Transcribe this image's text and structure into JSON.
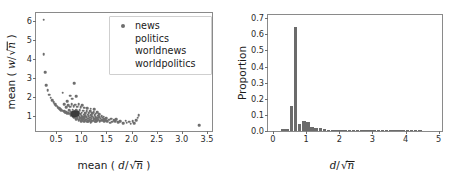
{
  "figure": {
    "panels": [
      "scatter",
      "histogram"
    ]
  },
  "chart_data": [
    {
      "type": "scatter",
      "title": "",
      "xlabel": "mean ( d/√n )",
      "ylabel": "mean ( w/√n )",
      "xlabel_parts": {
        "prefix": "mean (",
        "numerator": "d",
        "slash": "/",
        "radical": "√",
        "radicand": "n",
        "suffix": ")"
      },
      "ylabel_parts": {
        "prefix": "mean (",
        "numerator": "w",
        "slash": "/",
        "radical": "√",
        "radicand": "n",
        "suffix": ")"
      },
      "xlim": [
        0.1,
        3.6
      ],
      "ylim": [
        0.2,
        6.4
      ],
      "xticks": [
        0.5,
        1.0,
        1.5,
        2.0,
        2.5,
        3.0,
        3.5
      ],
      "xticklabels": [
        "0.5",
        "1.0",
        "1.5",
        "2.0",
        "2.5",
        "3.0",
        "3.5"
      ],
      "yticks": [
        1,
        2,
        3,
        4,
        5,
        6
      ],
      "yticklabels": [
        "1",
        "2",
        "3",
        "4",
        "5",
        "6"
      ],
      "grid": false,
      "legend_position": "upper right",
      "legend": [
        {
          "label": "news",
          "marker": "o",
          "color": "#6e6e6e",
          "marker_visible": true
        },
        {
          "label": "politics",
          "marker": "o",
          "color": "#ffffff",
          "marker_visible": false
        },
        {
          "label": "worldnews",
          "marker": "o",
          "color": "#ffffff",
          "marker_visible": false
        },
        {
          "label": "worldpolitics",
          "marker": "o",
          "color": "#ffffff",
          "marker_visible": false
        }
      ],
      "marker_color": "#6e6e6e",
      "points": [
        [
          0.25,
          6.05
        ],
        [
          0.25,
          4.25
        ],
        [
          0.28,
          3.3
        ],
        [
          0.3,
          2.62
        ],
        [
          0.33,
          2.35
        ],
        [
          0.36,
          2.1
        ],
        [
          0.39,
          1.95
        ],
        [
          0.42,
          1.82
        ],
        [
          0.45,
          1.7
        ],
        [
          0.48,
          1.6
        ],
        [
          0.5,
          1.52
        ],
        [
          0.53,
          1.45
        ],
        [
          0.56,
          1.4
        ],
        [
          0.58,
          1.35
        ],
        [
          0.6,
          1.3
        ],
        [
          0.63,
          1.27
        ],
        [
          0.66,
          1.24
        ],
        [
          0.68,
          1.2
        ],
        [
          0.7,
          1.18
        ],
        [
          0.72,
          1.15
        ],
        [
          0.75,
          1.13
        ],
        [
          0.63,
          2.22
        ],
        [
          0.86,
          2.72
        ],
        [
          0.78,
          2.05
        ],
        [
          0.72,
          1.78
        ],
        [
          0.82,
          1.9
        ],
        [
          0.9,
          2.02
        ],
        [
          0.66,
          1.62
        ],
        [
          0.74,
          1.55
        ],
        [
          0.81,
          1.62
        ],
        [
          0.88,
          1.58
        ],
        [
          0.95,
          1.62
        ],
        [
          1.02,
          1.55
        ],
        [
          0.7,
          1.45
        ],
        [
          0.78,
          1.48
        ],
        [
          0.85,
          1.5
        ],
        [
          0.92,
          1.47
        ],
        [
          0.99,
          1.45
        ],
        [
          1.06,
          1.43
        ],
        [
          1.12,
          1.4
        ],
        [
          1.19,
          1.38
        ],
        [
          1.26,
          1.35
        ],
        [
          0.76,
          1.3
        ],
        [
          0.83,
          1.32
        ],
        [
          0.9,
          1.3
        ],
        [
          0.97,
          1.28
        ],
        [
          1.04,
          1.27
        ],
        [
          1.11,
          1.25
        ],
        [
          1.18,
          1.23
        ],
        [
          1.25,
          1.2
        ],
        [
          1.32,
          1.18
        ],
        [
          0.8,
          1.2
        ],
        [
          0.87,
          1.19
        ],
        [
          0.94,
          1.18
        ],
        [
          1.01,
          1.17
        ],
        [
          1.08,
          1.15
        ],
        [
          1.15,
          1.14
        ],
        [
          1.22,
          1.12
        ],
        [
          1.29,
          1.1
        ],
        [
          1.36,
          1.08
        ],
        [
          0.78,
          1.1
        ],
        [
          0.85,
          1.09
        ],
        [
          0.92,
          1.08
        ],
        [
          0.99,
          1.07
        ],
        [
          1.06,
          1.06
        ],
        [
          1.13,
          1.05
        ],
        [
          1.2,
          1.04
        ],
        [
          1.27,
          1.02
        ],
        [
          1.34,
          1.0
        ],
        [
          1.41,
          0.98
        ],
        [
          0.8,
          1.02
        ],
        [
          0.87,
          1.01
        ],
        [
          0.94,
          1.0
        ],
        [
          1.01,
          0.99
        ],
        [
          1.08,
          0.98
        ],
        [
          1.15,
          0.97
        ],
        [
          1.22,
          0.96
        ],
        [
          1.29,
          0.94
        ],
        [
          1.36,
          0.92
        ],
        [
          1.43,
          0.9
        ],
        [
          0.83,
          0.95
        ],
        [
          0.9,
          0.94
        ],
        [
          0.97,
          0.93
        ],
        [
          1.04,
          0.92
        ],
        [
          1.11,
          0.91
        ],
        [
          1.18,
          0.9
        ],
        [
          1.25,
          0.88
        ],
        [
          1.32,
          0.87
        ],
        [
          1.39,
          0.85
        ],
        [
          1.46,
          0.83
        ],
        [
          0.86,
          0.89
        ],
        [
          0.93,
          0.88
        ],
        [
          1.0,
          0.87
        ],
        [
          1.07,
          0.86
        ],
        [
          1.14,
          0.85
        ],
        [
          1.21,
          0.84
        ],
        [
          1.28,
          0.82
        ],
        [
          1.35,
          0.8
        ],
        [
          1.42,
          0.78
        ],
        [
          1.49,
          0.76
        ],
        [
          0.9,
          0.83
        ],
        [
          0.97,
          0.82
        ],
        [
          1.04,
          0.81
        ],
        [
          1.11,
          0.8
        ],
        [
          1.18,
          0.79
        ],
        [
          1.25,
          0.78
        ],
        [
          1.32,
          0.76
        ],
        [
          1.39,
          0.74
        ],
        [
          1.46,
          0.72
        ],
        [
          0.95,
          0.78
        ],
        [
          1.02,
          0.77
        ],
        [
          1.09,
          0.76
        ],
        [
          1.16,
          0.75
        ],
        [
          1.23,
          0.74
        ],
        [
          1.3,
          0.72
        ],
        [
          1.37,
          0.7
        ],
        [
          1.0,
          0.73
        ],
        [
          1.07,
          0.72
        ],
        [
          1.14,
          0.71
        ],
        [
          1.21,
          0.7
        ],
        [
          1.28,
          0.69
        ],
        [
          1.05,
          0.69
        ],
        [
          1.12,
          0.68
        ],
        [
          1.19,
          0.67
        ],
        [
          0.86,
          1.12
        ],
        [
          0.88,
          1.15
        ],
        [
          0.9,
          1.1
        ],
        [
          0.92,
          1.13
        ],
        [
          0.84,
          1.08
        ],
        [
          0.87,
          1.05
        ],
        [
          0.91,
          1.04
        ],
        [
          0.95,
          1.1
        ],
        [
          1.52,
          0.72
        ],
        [
          1.58,
          0.64
        ],
        [
          1.62,
          0.68
        ],
        [
          1.68,
          0.7
        ],
        [
          1.73,
          0.66
        ],
        [
          1.78,
          0.72
        ],
        [
          1.83,
          0.6
        ],
        [
          1.88,
          0.74
        ],
        [
          1.9,
          0.64
        ],
        [
          1.95,
          0.68
        ],
        [
          1.98,
          0.58
        ],
        [
          2.02,
          0.7
        ],
        [
          2.05,
          0.62
        ],
        [
          2.09,
          0.78
        ],
        [
          2.12,
          0.9
        ],
        [
          2.14,
          1.02
        ],
        [
          1.55,
          0.8
        ],
        [
          1.6,
          0.85
        ],
        [
          1.66,
          0.78
        ],
        [
          1.7,
          0.82
        ],
        [
          1.45,
          0.95
        ],
        [
          1.5,
          0.88
        ],
        [
          3.35,
          0.5
        ]
      ],
      "dense_points": [
        [
          0.86,
          1.12
        ],
        [
          0.88,
          1.14
        ],
        [
          0.9,
          1.11
        ],
        [
          0.87,
          1.09
        ],
        [
          0.89,
          1.07
        ],
        [
          0.85,
          1.13
        ],
        [
          0.91,
          1.13
        ],
        [
          0.86,
          1.06
        ],
        [
          0.92,
          1.08
        ],
        [
          0.84,
          1.1
        ]
      ]
    },
    {
      "type": "bar",
      "title": "",
      "xlabel": "d/√n",
      "ylabel": "Proportion",
      "xlabel_parts": {
        "numerator": "d",
        "slash": "/",
        "radical": "√",
        "radicand": "n"
      },
      "xlim": [
        -0.15,
        5.1
      ],
      "ylim": [
        0.0,
        0.72
      ],
      "xticks": [
        0,
        1,
        2,
        3,
        4,
        5
      ],
      "xticklabels": [
        "0",
        "1",
        "2",
        "3",
        "4",
        "5"
      ],
      "yticks": [
        0.0,
        0.1,
        0.2,
        0.3,
        0.4,
        0.5,
        0.6,
        0.7
      ],
      "yticklabels": [
        "0.0",
        "0.1",
        "0.2",
        "0.3",
        "0.4",
        "0.5",
        "0.6",
        "0.7"
      ],
      "grid": false,
      "bar_color": "#6b6b6b",
      "bin_width": 0.125,
      "bins": [
        {
          "x": 0.3125,
          "value": 0.012
        },
        {
          "x": 0.4375,
          "value": 0.012
        },
        {
          "x": 0.5625,
          "value": 0.155
        },
        {
          "x": 0.6875,
          "value": 0.645
        },
        {
          "x": 0.8125,
          "value": 0.045
        },
        {
          "x": 0.9375,
          "value": 0.06
        },
        {
          "x": 1.0625,
          "value": 0.055
        },
        {
          "x": 1.1875,
          "value": 0.022
        },
        {
          "x": 1.3125,
          "value": 0.018
        },
        {
          "x": 1.4375,
          "value": 0.017
        },
        {
          "x": 1.5625,
          "value": 0.01
        },
        {
          "x": 1.6875,
          "value": 0.007
        },
        {
          "x": 1.8125,
          "value": 0.005
        },
        {
          "x": 1.9375,
          "value": 0.004
        },
        {
          "x": 2.0625,
          "value": 0.004
        },
        {
          "x": 2.1875,
          "value": 0.003
        },
        {
          "x": 2.3125,
          "value": 0.002
        },
        {
          "x": 2.4375,
          "value": 0.002
        },
        {
          "x": 2.5625,
          "value": 0.002
        },
        {
          "x": 2.6875,
          "value": 0.002
        },
        {
          "x": 2.8125,
          "value": 0.002
        },
        {
          "x": 2.9375,
          "value": 0.002
        },
        {
          "x": 3.0625,
          "value": 0.0015
        },
        {
          "x": 3.1875,
          "value": 0.0015
        },
        {
          "x": 3.3125,
          "value": 0.0015
        },
        {
          "x": 3.4375,
          "value": 0.001
        },
        {
          "x": 3.5625,
          "value": 0.001
        },
        {
          "x": 3.6875,
          "value": 0.001
        },
        {
          "x": 3.8125,
          "value": 0.001
        },
        {
          "x": 3.9375,
          "value": 0.001
        },
        {
          "x": 4.0625,
          "value": 0.001
        },
        {
          "x": 4.1875,
          "value": 0.001
        },
        {
          "x": 4.3125,
          "value": 0.0008
        },
        {
          "x": 4.4375,
          "value": 0.0008
        }
      ]
    }
  ]
}
